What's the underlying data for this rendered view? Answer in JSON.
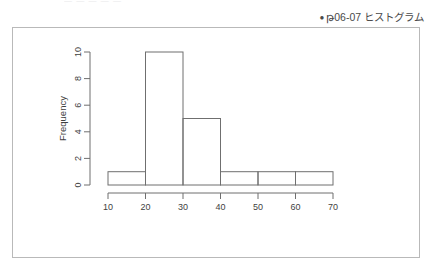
{
  "page": {
    "top_cut_text": "— — — — —",
    "background_color": "#ffffff"
  },
  "caption": {
    "bullet": "●",
    "text": "թ06-07 ヒストグラム",
    "figure_number": "06-07",
    "figure_word": "կ",
    "title_word": "ヒストグラム"
  },
  "frame": {
    "border_color": "#b9b9b9"
  },
  "chart_data": {
    "type": "bar",
    "chart_style": "histogram",
    "title": "",
    "subtitle": "",
    "xlabel": "",
    "ylabel": "Frequency",
    "categories": [
      "10-20",
      "20-30",
      "30-40",
      "40-50",
      "50-60",
      "60-70"
    ],
    "bin_edges": [
      10,
      20,
      30,
      40,
      50,
      60,
      70
    ],
    "values": [
      1,
      10,
      5,
      1,
      1,
      1
    ],
    "x": [
      15,
      25,
      35,
      45,
      55,
      65
    ],
    "xlim": [
      10,
      70
    ],
    "ylim": [
      0,
      10
    ],
    "xticks": [
      10,
      20,
      30,
      40,
      50,
      60,
      70
    ],
    "yticks": [
      0,
      2,
      4,
      6,
      8,
      10
    ],
    "xticklabels": [
      "10",
      "20",
      "30",
      "40",
      "50",
      "60",
      "70"
    ],
    "yticklabels": [
      "0",
      "2",
      "4",
      "6",
      "8",
      "10"
    ],
    "grid": false,
    "legend": null,
    "bar_fill": "none",
    "bar_stroke": "#6f6f6f",
    "axis_color": "#6f6f6f"
  }
}
